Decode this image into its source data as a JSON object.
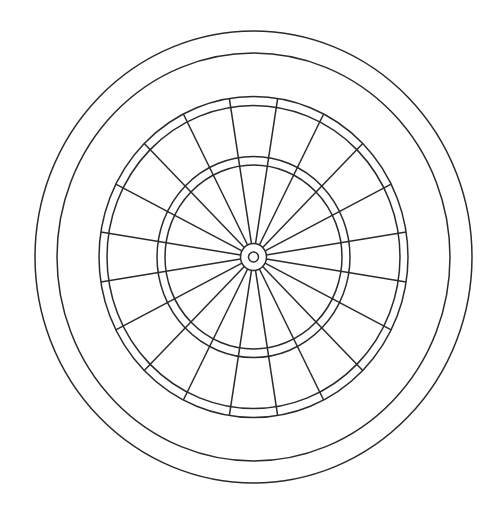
{
  "figure": {
    "stroke_color": "#2a2a2a",
    "background": "#ffffff",
    "center": [
      253.5,
      257
    ],
    "segments": 20,
    "segment_offset_deg": 9,
    "rings": [
      {
        "name": "outer-rim",
        "rx": 218.5,
        "ry": 226
      },
      {
        "name": "surround-inner",
        "rx": 196.5,
        "ry": 204
      },
      {
        "name": "double-outer",
        "rx": 154.5,
        "ry": 160.5
      },
      {
        "name": "double-inner",
        "rx": 146.5,
        "ry": 151.5
      },
      {
        "name": "treble-outer",
        "rx": 96.5,
        "ry": 100.5
      },
      {
        "name": "treble-inner",
        "rx": 88.5,
        "ry": 92
      },
      {
        "name": "outer-bull",
        "rx": 13,
        "ry": 13.5
      },
      {
        "name": "bullseye",
        "rx": 5,
        "ry": 5
      }
    ]
  }
}
